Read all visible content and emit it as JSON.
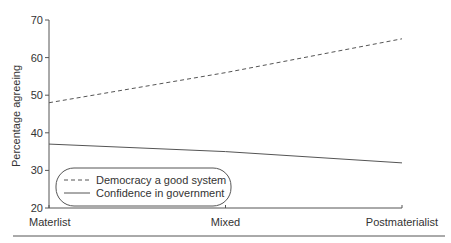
{
  "chart_data": {
    "type": "line",
    "title": "",
    "xlabel": "",
    "ylabel": "Percentage agreeing",
    "categories": [
      "Materlist",
      "Mixed",
      "Postmaterialist"
    ],
    "series": [
      {
        "name": "Democracy a good system",
        "values": [
          48,
          56,
          65
        ],
        "style": "dashed"
      },
      {
        "name": "Confidence in government",
        "values": [
          37,
          35,
          32
        ],
        "style": "solid"
      }
    ],
    "ylim": [
      20,
      70
    ],
    "yticks": [
      20,
      30,
      40,
      50,
      60,
      70
    ],
    "grid": false,
    "legend_position": "lower left"
  },
  "colors": {
    "line": "#555555",
    "axis": "#555555",
    "text": "#333333"
  }
}
